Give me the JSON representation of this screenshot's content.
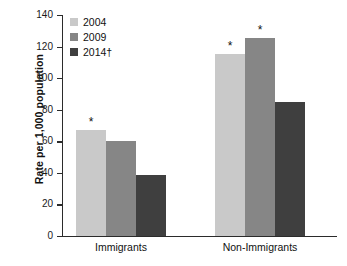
{
  "chart_data": {
    "type": "bar",
    "title": "",
    "subtitle": "",
    "xlabel": "",
    "ylabel": "Rate per 1,000 population",
    "categories": [
      "Immigrants",
      "Non-Immigrants"
    ],
    "series": [
      {
        "name": "2004",
        "color": "#c9c9c9",
        "values": [
          67,
          115.5
        ],
        "significance": [
          "*",
          "*"
        ]
      },
      {
        "name": "2009",
        "color": "#868686",
        "values": [
          60,
          125.5
        ],
        "significance": [
          "",
          "*"
        ]
      },
      {
        "name": "2014†",
        "color": "#3f3f3f",
        "values": [
          38.5,
          85
        ],
        "significance": [
          "",
          ""
        ]
      }
    ],
    "ylim": [
      0,
      140
    ],
    "yticks": [
      0,
      20,
      40,
      60,
      80,
      100,
      120,
      140
    ],
    "ytick_labels": [
      "0",
      "20",
      "40",
      "60",
      "80",
      "100",
      "120",
      "140"
    ],
    "grid": false,
    "legend_position": "top-left",
    "significance_marker": "*"
  },
  "legend": {
    "entries": [
      {
        "label": "2004",
        "color": "#c9c9c9"
      },
      {
        "label": "2009",
        "color": "#868686"
      },
      {
        "label": "2014†",
        "color": "#3f3f3f"
      }
    ]
  },
  "axes": {
    "y_title": "Rate per 1,000 population",
    "y_tick_labels": [
      "140",
      "120",
      "100",
      "80",
      "60",
      "40",
      "20",
      "0"
    ],
    "x_tick_labels": [
      "Immigrants",
      "Non-Immigrants"
    ]
  },
  "annotations": {
    "star": "*"
  }
}
